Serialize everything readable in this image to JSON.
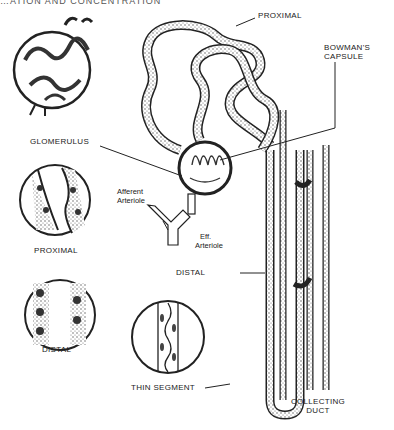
{
  "header": {
    "text": "…ATION AND CONCENTRATION"
  },
  "labels": {
    "proximal_top": "PROXIMAL",
    "bowmans_capsule_line1": "BOWMAN'S",
    "bowmans_capsule_line2": "CAPSULE",
    "glomerulus": "GLOMERULUS",
    "afferent_line1": "Afferent",
    "afferent_line2": "Arteriole",
    "efferent_line1": "Eff.",
    "efferent_line2": "Arteriole",
    "distal_main": "DISTAL",
    "proximal_inset": "PROXIMAL",
    "distal_inset": "DISTAL",
    "thin_segment": "THIN SEGMENT",
    "collecting_line1": "COLLECTING",
    "collecting_line2": "DUCT"
  },
  "colors": {
    "ink": "#222222",
    "stipple": "#666666",
    "paper": "#ffffff"
  }
}
